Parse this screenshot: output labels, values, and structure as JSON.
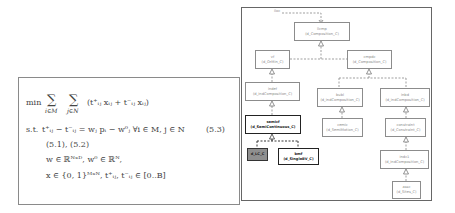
{
  "equation": {
    "objective_prefix": "min",
    "sum1_sub": "i∈M",
    "sum2_sub": "j∈N",
    "objective_body": "(t⁺ᵢⱼ xᵢⱼ + t⁻ᵢⱼ xᵢⱼ)",
    "constraint_prefix": "s.t.",
    "constraint_main": "t⁺ᵢⱼ − t⁻ᵢⱼ = wⱼ pᵢ − w⁰ⱼ   ∀i ∈ M, j ∈ N",
    "constraint_number": "(5.3)",
    "refs": "(5.1),   (5.2)",
    "domain_w": "w ∈ ℝᴺˣᴰ,   w⁰ ∈ ℝᴺ,",
    "domain_x": "x ∈ {0, 1}ᴹˣᴺ,   t⁺ᵢⱼ, t⁻ᵢⱼ ∈ [0..B]"
  },
  "diagram": {
    "root_label": "iloc",
    "nodes": [
      {
        "id": "llcmp",
        "name": "llcmp",
        "type": "(d_Composition_C)",
        "style": "normal"
      },
      {
        "id": "vf",
        "name": "vf",
        "type": "(d_OrMin_C)",
        "style": "normal"
      },
      {
        "id": "cmpdc",
        "name": "cmpdc",
        "type": "(d_Composition_C)",
        "style": "normal"
      },
      {
        "id": "indef",
        "name": "indef",
        "type": "(d_indComposition_C)",
        "style": "normal"
      },
      {
        "id": "bubl",
        "name": "bubl",
        "type": "(d_indComposition_C)",
        "style": "normal"
      },
      {
        "id": "inbd",
        "name": "inbd",
        "type": "(d_indComposition_C)",
        "style": "normal"
      },
      {
        "id": "semicf",
        "name": "semicf",
        "type": "(d_SemiContinuous_C)",
        "style": "bold"
      },
      {
        "id": "cemic",
        "name": "cemic",
        "type": "(d_SemiMotion_C)",
        "style": "normal"
      },
      {
        "id": "constraint",
        "name": "constraint",
        "type": "(d_Constraint_C)",
        "style": "normal"
      },
      {
        "id": "dlc",
        "name": "d_LC_C",
        "type": "",
        "style": "filled"
      },
      {
        "id": "bmf",
        "name": "bmf",
        "type": "(d_SingleBV_C)",
        "style": "bold"
      },
      {
        "id": "indc1",
        "name": "indc1",
        "type": "(d_indComposition_C)",
        "style": "normal"
      },
      {
        "id": "assc",
        "name": "assc",
        "type": "(d_Sites_C)",
        "style": "normal"
      }
    ]
  }
}
